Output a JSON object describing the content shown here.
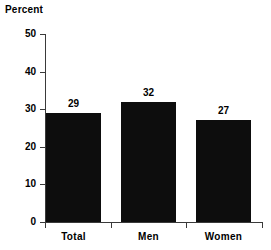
{
  "chart_data": {
    "type": "bar",
    "title": "",
    "ylabel": "Percent",
    "xlabel": "",
    "categories": [
      "Total",
      "Men",
      "Women"
    ],
    "values": [
      29,
      32,
      27
    ],
    "value_labels": [
      "29",
      "32",
      "27"
    ],
    "ylim": [
      0,
      50
    ],
    "yticks": [
      0,
      10,
      20,
      30,
      40,
      50
    ],
    "ytick_labels": [
      "0",
      "10",
      "20",
      "30",
      "40",
      "50"
    ],
    "grid": false,
    "legend": null,
    "bar_color": "#0d0d0d",
    "axis_color": "#3a3a3a",
    "background": "#ffffff"
  },
  "axis": {
    "y_title": "Percent"
  }
}
